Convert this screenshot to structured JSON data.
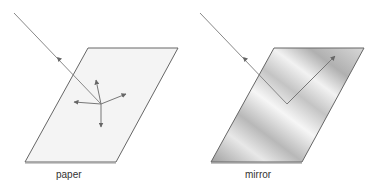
{
  "diagram": {
    "panels": [
      {
        "id": "paper",
        "label": "paper",
        "surface": "diffuse",
        "fill": "#f4f4f4",
        "edge_color": "#666666",
        "reflection": "scattered in many directions"
      },
      {
        "id": "mirror",
        "label": "mirror",
        "surface": "specular",
        "fill_gradient": [
          "#a8a8a8",
          "#f4f4f4",
          "#b4b4b4",
          "#f0f0f0",
          "#9c9c9c"
        ],
        "edge_color": "#666666",
        "reflection": "single reflected ray"
      }
    ],
    "ray_color": "#888888",
    "arrow_color": "#666666"
  }
}
